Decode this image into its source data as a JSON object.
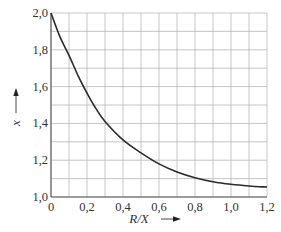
{
  "chart_data": {
    "type": "line",
    "title": "",
    "xlabel": "R/X",
    "ylabel": "x",
    "xlim": [
      0,
      1.2
    ],
    "ylim": [
      1.0,
      2.0
    ],
    "grid": true,
    "legend": null,
    "x_ticks": [
      "0",
      "0,2",
      "0,4",
      "0,6",
      "0,8",
      "1,0",
      "1,2"
    ],
    "y_ticks": [
      "1,0",
      "1,2",
      "1,4",
      "1,6",
      "1,8",
      "2,0"
    ],
    "x_minor_step": 0.1,
    "y_minor_step": 0.1,
    "series": [
      {
        "name": "x",
        "x": [
          0,
          0.05,
          0.1,
          0.15,
          0.2,
          0.25,
          0.3,
          0.4,
          0.5,
          0.6,
          0.7,
          0.8,
          0.9,
          1.0,
          1.1,
          1.2
        ],
        "values": [
          2.0,
          1.87,
          1.77,
          1.66,
          1.565,
          1.48,
          1.41,
          1.31,
          1.24,
          1.18,
          1.136,
          1.105,
          1.083,
          1.069,
          1.06,
          1.054
        ]
      }
    ]
  },
  "axes": {
    "x_label": "R/X",
    "y_label": "x",
    "x_arrow": "right-arrow",
    "y_arrow": "up-arrow"
  },
  "colors": {
    "grid": "#b8b8b8",
    "axis": "#555555",
    "curve": "#2a2a2a",
    "text": "#333333"
  }
}
